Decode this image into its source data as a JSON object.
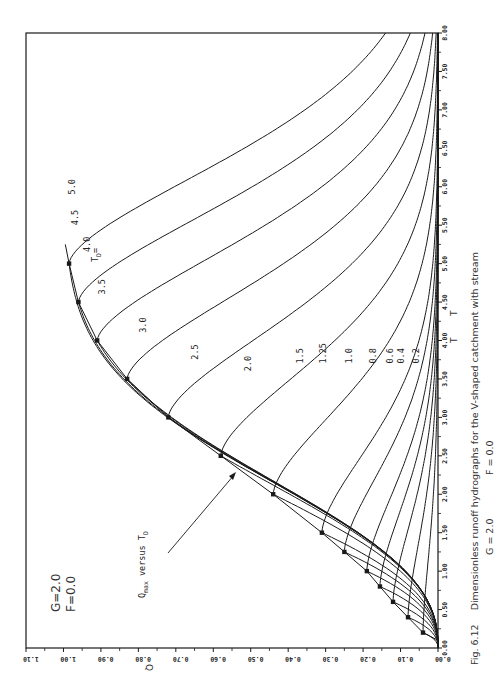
{
  "figure": {
    "caption_label": "Fig. 6.12",
    "caption_line1": "Dimensionless runoff hydrographs for the V-shaped catchment with stream",
    "caption_G": "G = 2.0",
    "caption_F": "F = 0.0",
    "param_G": "G=2.0",
    "param_F": "F=0.0",
    "td_label": "T",
    "td_sub": "D",
    "td_eq": "=",
    "qmax_label_q": "Q",
    "qmax_label_sub": "max",
    "qmax_label_versus": " versus T",
    "qmax_label_tsub": "D",
    "q_axis_label": "Q",
    "t_axis_label_1": "T",
    "t_axis_label_2": "T",
    "line_color": "#1a1a1a"
  },
  "chart_data": {
    "type": "line",
    "xlabel": "T",
    "ylabel": "Q",
    "xlim": [
      0.0,
      8.0
    ],
    "ylim": [
      0.0,
      1.1
    ],
    "orientation": "rotated 90 degrees counter-clockwise (T axis vertical on right, Q axis horizontal at bottom)",
    "grid": false,
    "x_ticks": [
      "0.00",
      "0.50",
      "1.00",
      "1.50",
      "2.00",
      "2.50",
      "3.00",
      "3.50",
      "4.00",
      "4.50",
      "5.00",
      "5.50",
      "6.00",
      "6.50",
      "7.00",
      "7.50",
      "8.00"
    ],
    "y_ticks": [
      "0.00",
      "0.10",
      "0.20",
      "0.30",
      "0.40",
      "0.50",
      "0.60",
      "0.70",
      "0.80",
      "0.90",
      "1.00",
      "1.10"
    ],
    "annotations": [
      "G=2.0",
      "F=0.0",
      "Qmax versus TD",
      "TD ="
    ],
    "series": [
      {
        "name": "TD = 0.2",
        "td": 0.2,
        "peak_T": 0.2,
        "peak_Q": 0.04
      },
      {
        "name": "TD = 0.4",
        "td": 0.4,
        "peak_T": 0.4,
        "peak_Q": 0.08
      },
      {
        "name": "TD = 0.6",
        "td": 0.6,
        "peak_T": 0.6,
        "peak_Q": 0.12
      },
      {
        "name": "TD = 0.8",
        "td": 0.8,
        "peak_T": 0.8,
        "peak_Q": 0.155
      },
      {
        "name": "TD = 1.0",
        "td": 1.0,
        "peak_T": 1.0,
        "peak_Q": 0.19
      },
      {
        "name": "TD = 1.25",
        "td": 1.25,
        "peak_T": 1.25,
        "peak_Q": 0.25
      },
      {
        "name": "TD = 1.5",
        "td": 1.5,
        "peak_T": 1.5,
        "peak_Q": 0.31
      },
      {
        "name": "TD = 2.0",
        "td": 2.0,
        "peak_T": 2.0,
        "peak_Q": 0.44
      },
      {
        "name": "TD = 2.5",
        "td": 2.5,
        "peak_T": 2.5,
        "peak_Q": 0.58
      },
      {
        "name": "TD = 3.0",
        "td": 3.0,
        "peak_T": 3.0,
        "peak_Q": 0.72
      },
      {
        "name": "TD = 3.5",
        "td": 3.5,
        "peak_T": 3.5,
        "peak_Q": 0.83
      },
      {
        "name": "TD = 4.0",
        "td": 4.0,
        "peak_T": 4.0,
        "peak_Q": 0.91
      },
      {
        "name": "TD = 4.5",
        "td": 4.5,
        "peak_T": 4.5,
        "peak_Q": 0.96
      },
      {
        "name": "TD = 5.0",
        "td": 5.0,
        "peak_T": 5.0,
        "peak_Q": 0.985
      }
    ],
    "qmax_curve": {
      "name": "Qmax versus TD",
      "marker": "square",
      "T": [
        0.2,
        0.4,
        0.6,
        0.8,
        1.0,
        1.25,
        1.5,
        2.0,
        2.5,
        3.0,
        3.5,
        4.0,
        4.5,
        5.0
      ],
      "Q": [
        0.04,
        0.08,
        0.12,
        0.155,
        0.19,
        0.25,
        0.31,
        0.44,
        0.58,
        0.72,
        0.83,
        0.91,
        0.96,
        0.985
      ]
    },
    "curve_labels": [
      {
        "text": "0.2",
        "T": 3.7,
        "Q": 0.05
      },
      {
        "text": "0.4",
        "T": 3.7,
        "Q": 0.09
      },
      {
        "text": "0.6",
        "T": 3.7,
        "Q": 0.12
      },
      {
        "text": "0.8",
        "T": 3.7,
        "Q": 0.165
      },
      {
        "text": "1.0",
        "T": 3.7,
        "Q": 0.23
      },
      {
        "text": "1.25",
        "T": 3.7,
        "Q": 0.3
      },
      {
        "text": "1.5",
        "T": 3.7,
        "Q": 0.36
      },
      {
        "text": "2.0",
        "T": 3.6,
        "Q": 0.5
      },
      {
        "text": "2.5",
        "T": 3.75,
        "Q": 0.64
      },
      {
        "text": "3.0",
        "T": 4.1,
        "Q": 0.78
      },
      {
        "text": "3.5",
        "T": 4.6,
        "Q": 0.89
      },
      {
        "text": "4.0",
        "T": 5.15,
        "Q": 0.93
      },
      {
        "text": "4.5",
        "T": 5.5,
        "Q": 0.96
      },
      {
        "text": "5.0",
        "T": 5.9,
        "Q": 0.97
      }
    ]
  }
}
